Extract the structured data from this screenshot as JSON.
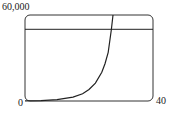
{
  "chart_data": {
    "type": "line",
    "title": "",
    "xlabel": "",
    "ylabel": "",
    "xlim": [
      0,
      40
    ],
    "ylim": [
      0,
      60000
    ],
    "x_tick_labels": [
      "0",
      "40"
    ],
    "y_tick_labels": [
      "60,000"
    ],
    "grid": false,
    "legend": null,
    "series": [
      {
        "name": "exponential curve",
        "x": [
          0,
          5,
          10,
          15,
          18,
          20,
          22,
          24,
          25,
          26,
          27,
          27.5
        ],
        "values": [
          100,
          300,
          900,
          2700,
          5000,
          8000,
          12500,
          20000,
          26000,
          34000,
          50000,
          60000
        ]
      },
      {
        "name": "horizontal line",
        "x": [
          0,
          40
        ],
        "values": [
          50000,
          50000
        ]
      }
    ]
  },
  "labels": {
    "y_max": "60,000",
    "x_min": "0",
    "x_max": "40"
  },
  "colors": {
    "line": "#222222",
    "frame": "#333333",
    "background": "#ffffff"
  }
}
